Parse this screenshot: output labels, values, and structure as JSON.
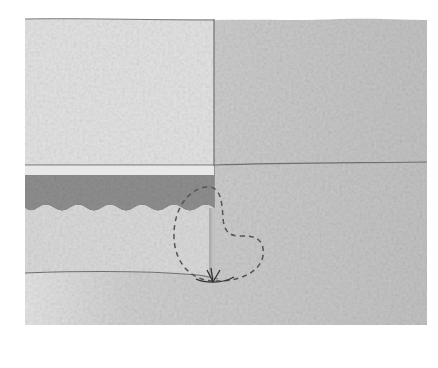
{
  "diagram": {
    "colors": {
      "background": "#ffffff",
      "upper_left_block": "#e3e3e3",
      "upper_right_textured": "#c9c9c9",
      "thin_band": "#e6e6e6",
      "dark_band": "#8f8f8f",
      "lower_left_block": "#d8d8d8",
      "textured_ground": "#c4c4c4",
      "outline": "#6f6f6f",
      "dashed_callout": "#555555"
    },
    "labels": []
  }
}
